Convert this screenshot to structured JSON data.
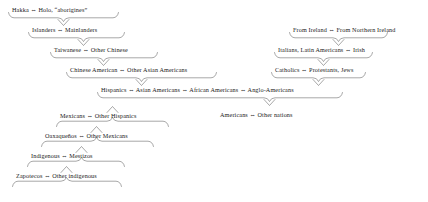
{
  "diagram": {
    "arrow_symbol": "⇔",
    "stroke_color": "#6d6d6d",
    "text_color": "#1a1a1a",
    "background_color": "#ffffff",
    "left_chain": [
      {
        "label": "Hakka ⇔ Holo, “aborigines”"
      },
      {
        "label": "Islanders ⇔ Mainlanders"
      },
      {
        "label": "Taiwanese ⇔ Other Chinese"
      },
      {
        "label": "Chinese American ⇔ Other Asian Americans"
      }
    ],
    "right_chain": [
      {
        "label": "From Ireland ⇔ From Northern Ireland"
      },
      {
        "label": "Italians, Latin Americans ⇔ Irish"
      },
      {
        "label": "Catholics ⇔ Protestants, Jews"
      }
    ],
    "center": {
      "label": "Hispanics ⇔ Asian Americans ⇔ African Americans ⇔ Anglo-Americans"
    },
    "bottom": {
      "label": "Americans ⇔ Other nations"
    },
    "lower_left_chain": [
      {
        "label": "Mexicans ⇔ Other Hispanics"
      },
      {
        "label": "Oaxaqueños ⇔ Other Mexicans"
      },
      {
        "label": "Indigenous ⇔ Mestizos"
      },
      {
        "label": "Zapotecos ⇔ Other indigenous"
      }
    ]
  }
}
